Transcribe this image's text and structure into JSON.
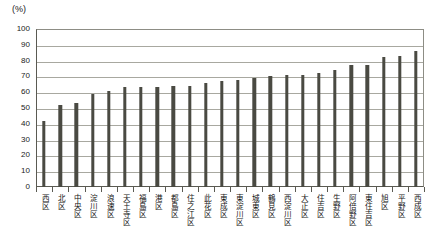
{
  "chart_data": {
    "type": "bar",
    "title": "",
    "subtitle": "",
    "xlabel": "",
    "ylabel": "(%)",
    "ylim": [
      0,
      100
    ],
    "ytick_step": 10,
    "yticks": [
      "100",
      "90",
      "80",
      "70",
      "60",
      "50",
      "40",
      "30",
      "20",
      "10",
      "0"
    ],
    "grid": true,
    "legend": "none",
    "bar_color": "#4a4a42",
    "categories": [
      "西区",
      "北区",
      "中央区",
      "淀川区",
      "浪速区",
      "天王寺区",
      "福島区",
      "港区",
      "都島区",
      "住之江区",
      "此花区",
      "東成区",
      "東淀川区",
      "城東区",
      "鶴見区",
      "西淀川区",
      "大正区",
      "住吉区",
      "生野区",
      "阿倍野区",
      "東住吉区",
      "旭区",
      "平野区",
      "西成区"
    ],
    "values": [
      42,
      52,
      53,
      59,
      61,
      63,
      63,
      63,
      64,
      64,
      66,
      67,
      68,
      69,
      70,
      71,
      71,
      72,
      74,
      77,
      77,
      82,
      83,
      86
    ]
  }
}
